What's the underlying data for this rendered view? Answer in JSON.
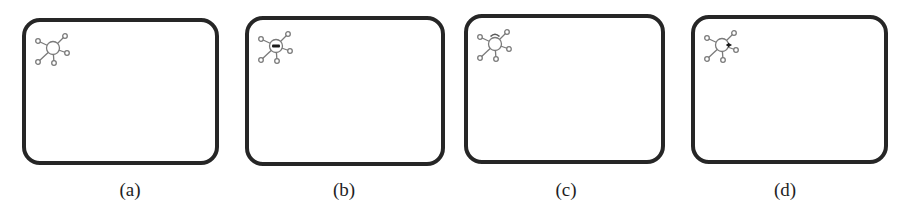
{
  "figure": {
    "panels": [
      {
        "id": "a",
        "caption": "(a)",
        "box": {
          "left": 22,
          "top": 18,
          "width": 197,
          "height": 147
        },
        "caption_center_x": 130,
        "marker": "none"
      },
      {
        "id": "b",
        "caption": "(b)",
        "box": {
          "left": 245,
          "top": 16,
          "width": 200,
          "height": 150
        },
        "caption_center_x": 344,
        "marker": "center-bar"
      },
      {
        "id": "c",
        "caption": "(c)",
        "box": {
          "left": 464,
          "top": 14,
          "width": 201,
          "height": 150
        },
        "caption_center_x": 566,
        "marker": "top-cap"
      },
      {
        "id": "d",
        "caption": "(d)",
        "box": {
          "left": 691,
          "top": 15,
          "width": 197,
          "height": 149
        },
        "caption_center_x": 785,
        "marker": "right-arrow"
      }
    ],
    "icon": {
      "name": "hub-network-icon",
      "stroke_color": "#7a7a7a",
      "marker_color": "#1a1a1a"
    },
    "colors": {
      "box_border": "#262626",
      "background": "#ffffff",
      "caption_text": "#1e1e1e"
    }
  }
}
